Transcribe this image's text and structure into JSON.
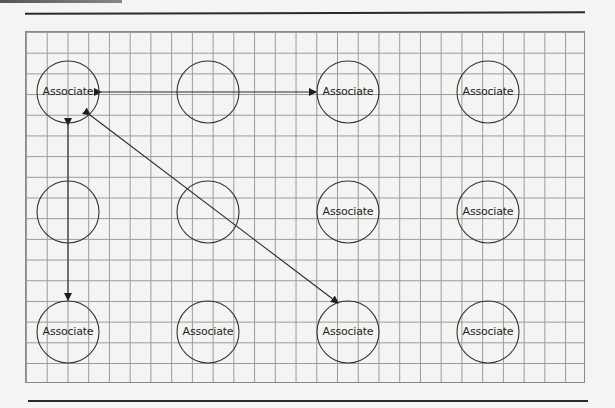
{
  "diagram": {
    "type": "node-grid",
    "background": "graph paper grid",
    "colors": {
      "line": "#2a2a2a",
      "grid": "#9a9a9a",
      "text": "#1e1e1e"
    },
    "nodes": [
      {
        "id": "r1c1",
        "row": 1,
        "col": 1,
        "label": "Associate",
        "cx": 68,
        "cy": 92
      },
      {
        "id": "r1c2",
        "row": 1,
        "col": 2,
        "label": "",
        "cx": 208,
        "cy": 92
      },
      {
        "id": "r1c3",
        "row": 1,
        "col": 3,
        "label": "Associate",
        "cx": 348,
        "cy": 92
      },
      {
        "id": "r1c4",
        "row": 1,
        "col": 4,
        "label": "Associate",
        "cx": 488,
        "cy": 92
      },
      {
        "id": "r2c1",
        "row": 2,
        "col": 1,
        "label": "",
        "cx": 68,
        "cy": 212
      },
      {
        "id": "r2c2",
        "row": 2,
        "col": 2,
        "label": "",
        "cx": 208,
        "cy": 212
      },
      {
        "id": "r2c3",
        "row": 2,
        "col": 3,
        "label": "Associate",
        "cx": 348,
        "cy": 212
      },
      {
        "id": "r2c4",
        "row": 2,
        "col": 4,
        "label": "Associate",
        "cx": 488,
        "cy": 212
      },
      {
        "id": "r3c1",
        "row": 3,
        "col": 1,
        "label": "Associate",
        "cx": 68,
        "cy": 332
      },
      {
        "id": "r3c2",
        "row": 3,
        "col": 2,
        "label": "Associate",
        "cx": 208,
        "cy": 332
      },
      {
        "id": "r3c3",
        "row": 3,
        "col": 3,
        "label": "Associate",
        "cx": 348,
        "cy": 332
      },
      {
        "id": "r3c4",
        "row": 3,
        "col": 4,
        "label": "Associate",
        "cx": 488,
        "cy": 332
      }
    ],
    "edges": [
      {
        "from": "r1c1",
        "to": "r1c3",
        "arrows": "both"
      },
      {
        "from": "r1c1",
        "to": "r3c1",
        "arrows": "both"
      },
      {
        "from": "r1c1",
        "to": "r3c3",
        "arrows": "both"
      }
    ]
  }
}
